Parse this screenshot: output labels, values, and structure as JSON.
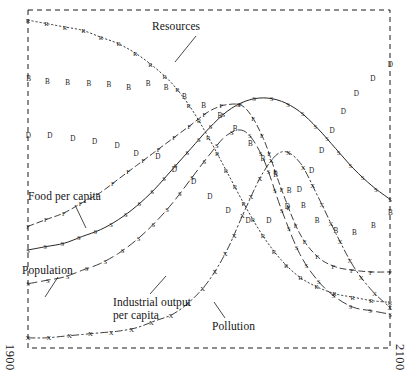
{
  "figure": {
    "kind": "line-chart",
    "frame_style": "dashed-rectangle",
    "background": "#ffffff",
    "ink": "#1a1a1a"
  },
  "axes": {
    "x_start_label": "1900",
    "x_end_label": "2100",
    "x_label_orientation": "vertical",
    "y_ticks_shown": false,
    "grid": false
  },
  "annotations": [
    {
      "name": "resources",
      "text": "Resources"
    },
    {
      "name": "food-per-capita",
      "text": "Food per capita"
    },
    {
      "name": "population",
      "text": "Population"
    },
    {
      "name": "industrial-output-per-capita",
      "text": "Industrial output",
      "text2": "per capita"
    },
    {
      "name": "pollution",
      "text": "Pollution"
    }
  ],
  "chart_data": {
    "type": "line",
    "title": "",
    "xlabel": "",
    "ylabel": "",
    "xlim": [
      1900,
      2100
    ],
    "ylim": [
      0,
      1
    ],
    "grid": false,
    "legend": "inline-annotations",
    "marker_letters": {
      "R": "Resources",
      "F": "Food per capita",
      "S": "Services / Population",
      "X": "Pollution",
      "B": "Crude birth rate",
      "D": "Crude death rate"
    },
    "x": [
      1900,
      1910,
      1920,
      1930,
      1940,
      1950,
      1960,
      1970,
      1980,
      1990,
      2000,
      2010,
      2020,
      2030,
      2040,
      2050,
      2060,
      2070,
      2080,
      2090,
      2100
    ],
    "series": [
      {
        "name": "Resources",
        "marker": "R",
        "dash": "dotted",
        "values": [
          0.97,
          0.96,
          0.95,
          0.94,
          0.92,
          0.9,
          0.87,
          0.83,
          0.78,
          0.71,
          0.62,
          0.52,
          0.42,
          0.33,
          0.26,
          0.21,
          0.18,
          0.16,
          0.15,
          0.14,
          0.135
        ]
      },
      {
        "name": "Food per capita",
        "marker": "F",
        "dash": "dashed",
        "values": [
          0.36,
          0.38,
          0.4,
          0.43,
          0.46,
          0.5,
          0.54,
          0.58,
          0.62,
          0.66,
          0.7,
          0.72,
          0.71,
          0.62,
          0.47,
          0.34,
          0.27,
          0.24,
          0.23,
          0.225,
          0.225
        ]
      },
      {
        "name": "Population",
        "marker": "S",
        "dash": "solid",
        "values": [
          0.29,
          0.3,
          0.31,
          0.33,
          0.35,
          0.38,
          0.42,
          0.47,
          0.53,
          0.59,
          0.65,
          0.7,
          0.73,
          0.74,
          0.73,
          0.7,
          0.65,
          0.59,
          0.53,
          0.48,
          0.44
        ]
      },
      {
        "name": "Industrial output per capita",
        "marker": "S",
        "dash": "longdash",
        "values": [
          0.19,
          0.2,
          0.21,
          0.23,
          0.25,
          0.28,
          0.32,
          0.37,
          0.43,
          0.5,
          0.57,
          0.63,
          0.64,
          0.56,
          0.41,
          0.28,
          0.2,
          0.15,
          0.12,
          0.11,
          0.1
        ]
      },
      {
        "name": "Pollution",
        "marker": "X",
        "dash": "dashdot",
        "values": [
          0.03,
          0.03,
          0.035,
          0.04,
          0.045,
          0.05,
          0.06,
          0.08,
          0.1,
          0.14,
          0.2,
          0.29,
          0.41,
          0.52,
          0.58,
          0.55,
          0.45,
          0.34,
          0.24,
          0.17,
          0.12
        ]
      },
      {
        "name": "Crude birth rate",
        "marker": "B",
        "dash": "none",
        "values": [
          0.8,
          0.79,
          0.785,
          0.78,
          0.78,
          0.775,
          0.77,
          0.79,
          0.76,
          0.74,
          0.71,
          0.67,
          0.62,
          0.56,
          0.49,
          0.43,
          0.38,
          0.35,
          0.34,
          0.36,
          0.4
        ]
      },
      {
        "name": "Crude death rate",
        "marker": "D",
        "dash": "none",
        "values": [
          0.63,
          0.63,
          0.625,
          0.62,
          0.61,
          0.6,
          0.575,
          0.575,
          0.53,
          0.5,
          0.45,
          0.41,
          0.38,
          0.37,
          0.4,
          0.47,
          0.56,
          0.66,
          0.74,
          0.8,
          0.84
        ]
      }
    ]
  }
}
